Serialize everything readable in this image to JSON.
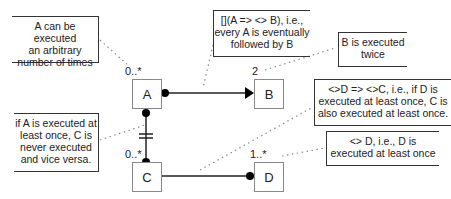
{
  "diagram": {
    "nodes": [
      {
        "id": "A",
        "label": "A",
        "multiplicity": "0..*"
      },
      {
        "id": "B",
        "label": "B",
        "multiplicity": "2"
      },
      {
        "id": "C",
        "label": "C",
        "multiplicity": "0..*"
      },
      {
        "id": "D",
        "label": "D",
        "multiplicity": "1..*"
      }
    ],
    "edges": [
      {
        "from": "A",
        "to": "B",
        "type": "response",
        "start": "dot",
        "end": "arrow"
      },
      {
        "from": "A",
        "to": "C",
        "type": "not-coexistence",
        "start": "dot",
        "end": "dot",
        "marker": "double-bar"
      },
      {
        "from": "C",
        "to": "D",
        "type": "responded-existence",
        "start": "none",
        "end": "dot"
      }
    ],
    "notes": [
      {
        "id": "note-a",
        "target": "A",
        "lines": [
          "A can be executed",
          "an arbitrary",
          "number of times"
        ]
      },
      {
        "id": "note-ab",
        "target": "A-B edge",
        "lines": [
          "[](A => <> B), i.e.,",
          "every A is eventually",
          "followed by B"
        ]
      },
      {
        "id": "note-b",
        "target": "B",
        "lines": [
          "B is executed",
          "twice"
        ]
      },
      {
        "id": "note-cd",
        "target": "C-D edge",
        "lines": [
          "<>D => <>C, i.e., if D is",
          "executed at least once, C is",
          "also executed at least once."
        ]
      },
      {
        "id": "note-ac",
        "target": "A-C edge",
        "lines": [
          "if A is executed at",
          "least once, C is",
          "never executed",
          "and vice versa."
        ]
      },
      {
        "id": "note-d",
        "target": "D",
        "lines": [
          "<> D, i.e., D is",
          "executed at least once"
        ]
      }
    ]
  }
}
